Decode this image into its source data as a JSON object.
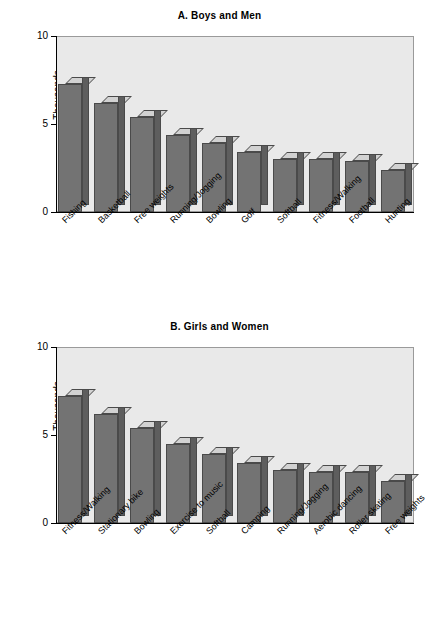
{
  "figure": {
    "ylabel": "Thousands",
    "yticks": [
      "10",
      "5",
      "0"
    ]
  },
  "chart_data": [
    {
      "type": "bar",
      "title": "A. Boys and Men",
      "xlabel": "",
      "ylabel": "Thousands",
      "ylim": [
        0,
        10
      ],
      "yticks": [
        0,
        5,
        10
      ],
      "grid": false,
      "legend": "none",
      "categories": [
        "Fishing",
        "Basketball",
        "Free weights",
        "Running/Jogging",
        "Bowling",
        "Golf",
        "Softball",
        "Fitness/Walking",
        "Football",
        "Hunting"
      ],
      "values": [
        7.3,
        6.2,
        5.4,
        4.4,
        3.9,
        3.4,
        3.0,
        3.0,
        2.9,
        2.4
      ]
    },
    {
      "type": "bar",
      "title": "B. Girls and Women",
      "xlabel": "",
      "ylabel": "Thousands",
      "ylim": [
        0,
        10
      ],
      "yticks": [
        0,
        5,
        10
      ],
      "grid": false,
      "legend": "none",
      "categories": [
        "Fitness/Walking",
        "Stationary bike",
        "Bowling",
        "Exercise to music",
        "Softball",
        "Camping",
        "Running/Jogging",
        "Aerobic dancing",
        "Roller skating",
        "Free weights"
      ],
      "values": [
        7.2,
        6.2,
        5.4,
        4.5,
        3.9,
        3.4,
        3.0,
        2.9,
        2.9,
        2.4
      ]
    }
  ]
}
